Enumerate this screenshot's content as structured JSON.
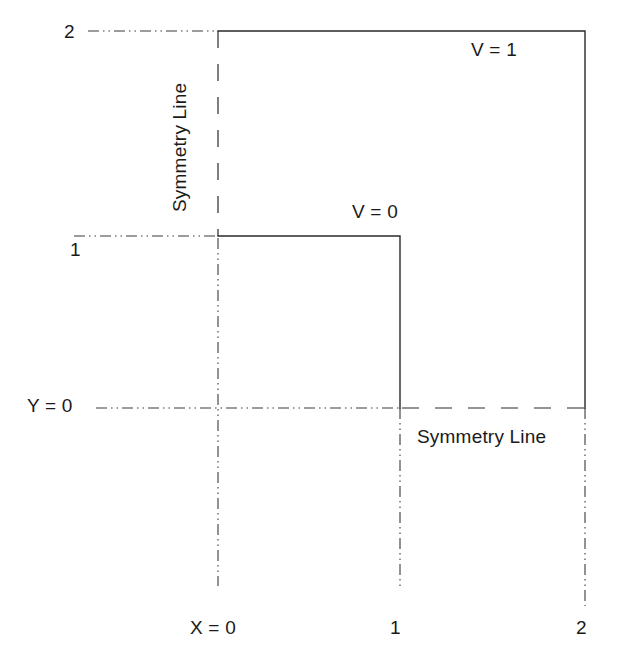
{
  "figure": {
    "type": "boundary-condition-domain-diagram",
    "background_color": "#ffffff",
    "line_color": "#1a1a1a",
    "text_color": "#1a1a1a"
  },
  "axes": {
    "x_label": "X = 0",
    "y_label": "Y = 0",
    "x_ticks": [
      "X = 0",
      "1",
      "2"
    ],
    "y_ticks": [
      "Y = 0",
      "1",
      "2"
    ],
    "x_tick_values": [
      0,
      1,
      2
    ],
    "y_tick_values": [
      0,
      1,
      2
    ],
    "xlim": [
      0,
      2
    ],
    "ylim": [
      0,
      2
    ]
  },
  "labels": {
    "y_two": "2",
    "y_one": "1",
    "y_zero": "Y = 0",
    "x_zero": "X = 0",
    "x_one": "1",
    "x_two": "2",
    "v_outer": "V = 1",
    "v_inner": "V = 0",
    "symmetry_horizontal": "Symmetry Line",
    "symmetry_vertical": "Symmetry Line"
  },
  "geometry": {
    "outer_boundary": {
      "label": "V = 1",
      "description": "outer solid L-shaped boundary from (0,2) to (2,2) to (2,0)",
      "points": [
        [
          0,
          2
        ],
        [
          2,
          2
        ],
        [
          2,
          0
        ]
      ],
      "style": "solid"
    },
    "inner_boundary": {
      "label": "V = 0",
      "description": "inner solid L-shaped boundary from (0,1) to (1,1) to (1,0)",
      "points": [
        [
          0,
          1
        ],
        [
          1,
          1
        ],
        [
          1,
          0
        ]
      ],
      "style": "solid"
    },
    "symmetry_line_vertical": {
      "label": "Symmetry Line",
      "x": 0,
      "from_y": 1,
      "to_y": 2,
      "style": "dashed"
    },
    "symmetry_line_horizontal": {
      "label": "Symmetry Line",
      "y": 0,
      "from_x": 1,
      "to_x": 2,
      "style": "dashed"
    },
    "gridlines": [
      {
        "orientation": "horizontal",
        "value": 2,
        "style": "dash-dot-dot"
      },
      {
        "orientation": "horizontal",
        "value": 1,
        "style": "dash-dot-dot"
      },
      {
        "orientation": "horizontal",
        "value": 0,
        "style": "dash-dot-dot"
      },
      {
        "orientation": "vertical",
        "value": 0,
        "style": "dash-dot-dot"
      },
      {
        "orientation": "vertical",
        "value": 1,
        "style": "dash-dot-dot"
      },
      {
        "orientation": "vertical",
        "value": 2,
        "style": "dash-dot-dot"
      }
    ]
  }
}
